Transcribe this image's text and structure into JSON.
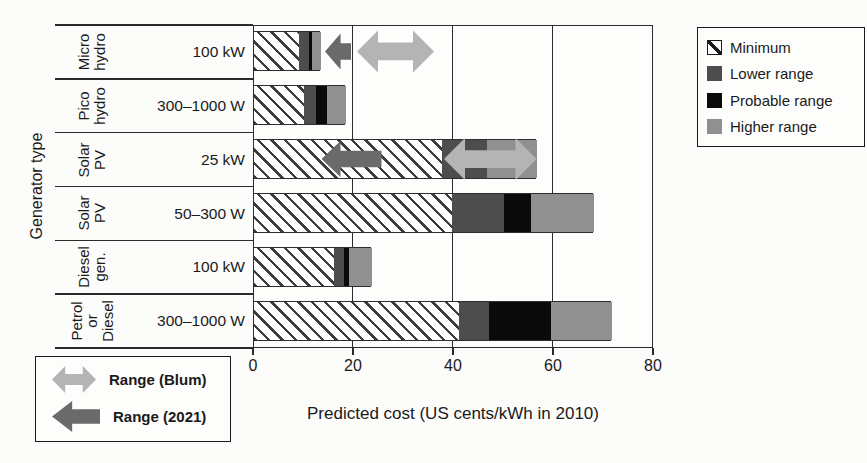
{
  "chart_data": {
    "type": "bar",
    "orientation": "horizontal",
    "xlabel": "Predicted cost (US cents/kWh in 2010)",
    "ylabel": "Generator type",
    "xlim": [
      0,
      80
    ],
    "xticks": [
      0,
      20,
      40,
      60,
      80
    ],
    "gridlines": [
      20,
      40,
      60
    ],
    "grid": "vertical-on",
    "legend_position": "top-right-outside",
    "colors": {
      "lower_range": "#4d4d4d",
      "probable_range": "#0a0a0a",
      "higher_range": "#909090",
      "blum_arrow": "#b4b4b4",
      "y2021_arrow": "#6a6a6a",
      "hatch_line": "#3d3d3d",
      "axis_line": "#2b2b2b"
    },
    "legend": {
      "entries": [
        {
          "label": "Minimum",
          "style": "hatch"
        },
        {
          "label": "Lower range",
          "style": "lower"
        },
        {
          "label": "Probable range",
          "style": "probable"
        },
        {
          "label": "Higher range",
          "style": "higher"
        }
      ]
    },
    "arrow_legend": {
      "entries": [
        {
          "label": "Range (Blum)",
          "kind": "blum"
        },
        {
          "label": "Range (2021)",
          "kind": "y2021"
        }
      ]
    },
    "categories": [
      {
        "group_lines": [
          "Micro",
          "hydro"
        ],
        "size_label": "100 kW",
        "segments": {
          "minimum": [
            0,
            9
          ],
          "lower": [
            9,
            11
          ],
          "probable": [
            11,
            11.6
          ],
          "higher": [
            11.6,
            13.4
          ]
        },
        "arrows": [
          {
            "kind": "y2021",
            "from": 14.2,
            "to": 19.4
          },
          {
            "kind": "blum",
            "from": 20.6,
            "to": 36
          }
        ]
      },
      {
        "group_lines": [
          "Pico",
          "hydro"
        ],
        "size_label": "300–1000 W",
        "segments": {
          "minimum": [
            0,
            10
          ],
          "lower": [
            10,
            12.4
          ],
          "probable": [
            12.4,
            14.6
          ],
          "higher": [
            14.6,
            18.4
          ]
        },
        "arrows": []
      },
      {
        "group_lines": [
          "Solar",
          "PV"
        ],
        "size_label": "25 kW",
        "segments": {
          "minimum": [
            0,
            37.5
          ],
          "lower": [
            37.5,
            46.5
          ],
          "probable": [
            46.5,
            46.5
          ],
          "higher": [
            46.5,
            56.5
          ]
        },
        "arrows": [
          {
            "kind": "y2021",
            "from": 13.5,
            "to": 25.5
          },
          {
            "kind": "blum",
            "from": 38,
            "to": 56.5
          }
        ]
      },
      {
        "group_lines": [
          "Solar",
          "PV"
        ],
        "size_label": "50–300 W",
        "segments": {
          "minimum": [
            0,
            39.6
          ],
          "lower": [
            39.6,
            50
          ],
          "probable": [
            50,
            55.4
          ],
          "higher": [
            55.4,
            68
          ]
        },
        "arrows": []
      },
      {
        "group_lines": [
          "Diesel",
          "gen."
        ],
        "size_label": "100 kW",
        "segments": {
          "minimum": [
            0,
            16
          ],
          "lower": [
            16,
            18
          ],
          "probable": [
            18,
            19
          ],
          "higher": [
            19,
            23.6
          ]
        },
        "arrows": []
      },
      {
        "group_lines": [
          "Petrol",
          "or",
          "Diesel"
        ],
        "size_label": "300–1000 W",
        "segments": {
          "minimum": [
            0,
            41
          ],
          "lower": [
            41,
            47
          ],
          "probable": [
            47,
            59.4
          ],
          "higher": [
            59.4,
            71.6
          ]
        },
        "arrows": []
      }
    ]
  }
}
